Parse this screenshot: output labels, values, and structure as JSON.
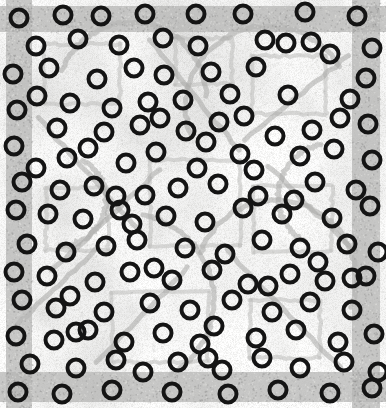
{
  "image": {
    "title": "Annotated pattern scan",
    "width": 386,
    "height": 408,
    "kind": "grayscale-scan-with-ring-markers"
  },
  "palette": {
    "paper": "#f6f6f5",
    "paper_light": "#fbfbfa",
    "border_band": "#b6b6b4",
    "border_band_dark": "#a3a3a1",
    "motif_line": "#bdbdbb",
    "motif_line_soft": "#d2d2d0",
    "motif_line_dark": "#a8a8a6",
    "marker_stroke": "#1a1a1a",
    "marker_fill": "none",
    "speckle": "#c9c9c7"
  },
  "border": {
    "name": "outer-frame-band",
    "top_height": 26,
    "bottom_height": 30,
    "left_width": 26,
    "right_width": 28,
    "inset": 6
  },
  "marker_style": {
    "shape": "ring",
    "diameter": 21,
    "stroke_width": 4.0,
    "color": "#141414",
    "count": 148
  },
  "markers": [
    {
      "x": 19,
      "y": 18
    },
    {
      "x": 63,
      "y": 15
    },
    {
      "x": 101,
      "y": 16
    },
    {
      "x": 145,
      "y": 14
    },
    {
      "x": 196,
      "y": 14
    },
    {
      "x": 243,
      "y": 14
    },
    {
      "x": 305,
      "y": 12
    },
    {
      "x": 311,
      "y": 42
    },
    {
      "x": 357,
      "y": 16
    },
    {
      "x": 78,
      "y": 39
    },
    {
      "x": 119,
      "y": 45
    },
    {
      "x": 163,
      "y": 38
    },
    {
      "x": 265,
      "y": 40
    },
    {
      "x": 286,
      "y": 43
    },
    {
      "x": 372,
      "y": 48
    },
    {
      "x": 13,
      "y": 74
    },
    {
      "x": 49,
      "y": 68
    },
    {
      "x": 97,
      "y": 79
    },
    {
      "x": 134,
      "y": 68
    },
    {
      "x": 164,
      "y": 75
    },
    {
      "x": 211,
      "y": 72
    },
    {
      "x": 256,
      "y": 67
    },
    {
      "x": 330,
      "y": 54
    },
    {
      "x": 366,
      "y": 78
    },
    {
      "x": 37,
      "y": 96
    },
    {
      "x": 70,
      "y": 103
    },
    {
      "x": 112,
      "y": 108
    },
    {
      "x": 148,
      "y": 102
    },
    {
      "x": 183,
      "y": 100
    },
    {
      "x": 230,
      "y": 94
    },
    {
      "x": 288,
      "y": 95
    },
    {
      "x": 350,
      "y": 99
    },
    {
      "x": 17,
      "y": 110
    },
    {
      "x": 57,
      "y": 128
    },
    {
      "x": 104,
      "y": 132
    },
    {
      "x": 140,
      "y": 125
    },
    {
      "x": 186,
      "y": 131
    },
    {
      "x": 219,
      "y": 122
    },
    {
      "x": 275,
      "y": 136
    },
    {
      "x": 312,
      "y": 130
    },
    {
      "x": 368,
      "y": 124
    },
    {
      "x": 14,
      "y": 146
    },
    {
      "x": 67,
      "y": 158
    },
    {
      "x": 126,
      "y": 163
    },
    {
      "x": 156,
      "y": 152
    },
    {
      "x": 197,
      "y": 168
    },
    {
      "x": 240,
      "y": 154
    },
    {
      "x": 300,
      "y": 156
    },
    {
      "x": 334,
      "y": 149
    },
    {
      "x": 372,
      "y": 160
    },
    {
      "x": 22,
      "y": 182
    },
    {
      "x": 60,
      "y": 190
    },
    {
      "x": 94,
      "y": 186
    },
    {
      "x": 145,
      "y": 195
    },
    {
      "x": 178,
      "y": 188
    },
    {
      "x": 218,
      "y": 184
    },
    {
      "x": 258,
      "y": 196
    },
    {
      "x": 315,
      "y": 182
    },
    {
      "x": 356,
      "y": 190
    },
    {
      "x": 16,
      "y": 210
    },
    {
      "x": 48,
      "y": 214
    },
    {
      "x": 83,
      "y": 219
    },
    {
      "x": 120,
      "y": 210
    },
    {
      "x": 166,
      "y": 216
    },
    {
      "x": 205,
      "y": 222
    },
    {
      "x": 243,
      "y": 208
    },
    {
      "x": 282,
      "y": 214
    },
    {
      "x": 332,
      "y": 218
    },
    {
      "x": 370,
      "y": 206
    },
    {
      "x": 27,
      "y": 244
    },
    {
      "x": 66,
      "y": 252
    },
    {
      "x": 106,
      "y": 246
    },
    {
      "x": 137,
      "y": 240
    },
    {
      "x": 185,
      "y": 248
    },
    {
      "x": 225,
      "y": 254
    },
    {
      "x": 262,
      "y": 240
    },
    {
      "x": 300,
      "y": 248
    },
    {
      "x": 347,
      "y": 244
    },
    {
      "x": 378,
      "y": 252
    },
    {
      "x": 14,
      "y": 272
    },
    {
      "x": 47,
      "y": 276
    },
    {
      "x": 95,
      "y": 282
    },
    {
      "x": 130,
      "y": 272
    },
    {
      "x": 172,
      "y": 280
    },
    {
      "x": 212,
      "y": 270
    },
    {
      "x": 248,
      "y": 284
    },
    {
      "x": 290,
      "y": 274
    },
    {
      "x": 325,
      "y": 281
    },
    {
      "x": 366,
      "y": 276
    },
    {
      "x": 22,
      "y": 300
    },
    {
      "x": 56,
      "y": 308
    },
    {
      "x": 70,
      "y": 296
    },
    {
      "x": 104,
      "y": 312
    },
    {
      "x": 150,
      "y": 303
    },
    {
      "x": 190,
      "y": 310
    },
    {
      "x": 232,
      "y": 300
    },
    {
      "x": 272,
      "y": 312
    },
    {
      "x": 310,
      "y": 302
    },
    {
      "x": 352,
      "y": 310
    },
    {
      "x": 16,
      "y": 336
    },
    {
      "x": 54,
      "y": 340
    },
    {
      "x": 88,
      "y": 330
    },
    {
      "x": 124,
      "y": 342
    },
    {
      "x": 163,
      "y": 333
    },
    {
      "x": 200,
      "y": 344
    },
    {
      "x": 214,
      "y": 326
    },
    {
      "x": 256,
      "y": 338
    },
    {
      "x": 296,
      "y": 330
    },
    {
      "x": 338,
      "y": 342
    },
    {
      "x": 374,
      "y": 334
    },
    {
      "x": 30,
      "y": 364
    },
    {
      "x": 76,
      "y": 368
    },
    {
      "x": 116,
      "y": 360
    },
    {
      "x": 143,
      "y": 372
    },
    {
      "x": 178,
      "y": 362
    },
    {
      "x": 222,
      "y": 370
    },
    {
      "x": 262,
      "y": 358
    },
    {
      "x": 300,
      "y": 368
    },
    {
      "x": 344,
      "y": 362
    },
    {
      "x": 378,
      "y": 372
    },
    {
      "x": 18,
      "y": 392
    },
    {
      "x": 62,
      "y": 394
    },
    {
      "x": 112,
      "y": 390
    },
    {
      "x": 172,
      "y": 392
    },
    {
      "x": 228,
      "y": 394
    },
    {
      "x": 278,
      "y": 390
    },
    {
      "x": 330,
      "y": 393
    },
    {
      "x": 372,
      "y": 388
    },
    {
      "x": 244,
      "y": 116
    },
    {
      "x": 198,
      "y": 46
    },
    {
      "x": 36,
      "y": 46
    },
    {
      "x": 88,
      "y": 148
    },
    {
      "x": 254,
      "y": 170
    },
    {
      "x": 340,
      "y": 118
    },
    {
      "x": 154,
      "y": 268
    },
    {
      "x": 116,
      "y": 196
    },
    {
      "x": 294,
      "y": 200
    },
    {
      "x": 206,
      "y": 142
    },
    {
      "x": 76,
      "y": 332
    },
    {
      "x": 318,
      "y": 262
    },
    {
      "x": 160,
      "y": 118
    },
    {
      "x": 268,
      "y": 286
    },
    {
      "x": 36,
      "y": 168
    },
    {
      "x": 208,
      "y": 358
    },
    {
      "x": 132,
      "y": 224
    },
    {
      "x": 352,
      "y": 278
    }
  ],
  "motif": {
    "description": "Faint grey ornamental line motif: concentric arcs, diagonal chevrons and rectangular frames on mottled paper",
    "arcs": [
      {
        "cx": 132,
        "cy": 96,
        "r": 74,
        "start": 200,
        "end": 360
      },
      {
        "cx": 268,
        "cy": 108,
        "r": 82,
        "start": 160,
        "end": 330
      },
      {
        "cx": 128,
        "cy": 300,
        "r": 86,
        "start": 280,
        "end": 60
      },
      {
        "cx": 276,
        "cy": 280,
        "r": 80,
        "start": 200,
        "end": 20
      },
      {
        "cx": 196,
        "cy": 204,
        "r": 58,
        "start": 0,
        "end": 360
      },
      {
        "cx": 60,
        "cy": 200,
        "r": 46,
        "start": 300,
        "end": 90
      },
      {
        "cx": 330,
        "cy": 196,
        "r": 52,
        "start": 120,
        "end": 260
      }
    ],
    "rects": [
      {
        "x": 44,
        "y": 44,
        "w": 76,
        "h": 60
      },
      {
        "x": 176,
        "y": 38,
        "w": 56,
        "h": 46
      },
      {
        "x": 252,
        "y": 56,
        "w": 74,
        "h": 58
      },
      {
        "x": 46,
        "y": 188,
        "w": 62,
        "h": 62
      },
      {
        "x": 254,
        "y": 186,
        "w": 78,
        "h": 66
      },
      {
        "x": 112,
        "y": 292,
        "w": 96,
        "h": 70
      },
      {
        "x": 250,
        "y": 300,
        "w": 70,
        "h": 58
      },
      {
        "x": 150,
        "y": 160,
        "w": 90,
        "h": 86
      }
    ],
    "diagonals": [
      {
        "x1": 38,
        "y1": 118,
        "x2": 140,
        "y2": 232
      },
      {
        "x1": 150,
        "y1": 40,
        "x2": 238,
        "y2": 150
      },
      {
        "x1": 244,
        "y1": 140,
        "x2": 348,
        "y2": 56
      },
      {
        "x1": 52,
        "y1": 270,
        "x2": 160,
        "y2": 170
      },
      {
        "x1": 226,
        "y1": 250,
        "x2": 340,
        "y2": 368
      },
      {
        "x1": 96,
        "y1": 362,
        "x2": 188,
        "y2": 268
      },
      {
        "x1": 268,
        "y1": 166,
        "x2": 356,
        "y2": 252
      },
      {
        "x1": 12,
        "y1": 330,
        "x2": 96,
        "y2": 250
      }
    ]
  }
}
